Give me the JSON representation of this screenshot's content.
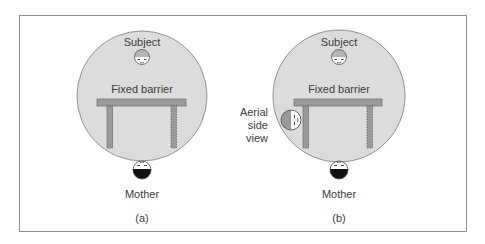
{
  "panels": [
    {
      "id": "a",
      "caption": "(a)",
      "labels": {
        "subject": "Subject",
        "barrier": "Fixed barrier",
        "mother": "Mother"
      }
    },
    {
      "id": "b",
      "caption": "(b)",
      "labels": {
        "subject": "Subject",
        "barrier": "Fixed barrier",
        "mother": "Mother",
        "side_view_line1": "Aerial",
        "side_view_line2": "side",
        "side_view_line3": "view"
      }
    }
  ],
  "colors": {
    "frame": "#8c8c8c",
    "circle_fill": "#dcdcdc",
    "circle_stroke": "#7a7a7a",
    "barrier": "#9a9a9a",
    "hair_light": "#b5b5b5",
    "hair_dark": "#111111",
    "text": "#3a3a3a"
  }
}
